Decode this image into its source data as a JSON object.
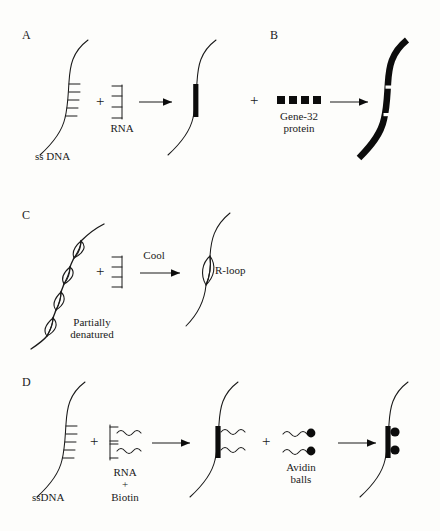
{
  "figure": {
    "background_color": "#fdfdfb",
    "ink_color": "#1a1a1a"
  },
  "panels": [
    {
      "id": "A",
      "letter": "A",
      "reactant_label": "ss DNA",
      "reagent_label": "RNA",
      "plus_1": "+",
      "description": "single stranded DNA plus RNA yields hybrid with black duplex bar"
    },
    {
      "id": "B",
      "letter": "B",
      "reagent_label": "Gene-32\nprotein",
      "plus_1": "+",
      "description": "gene-32 protein squares coat the ssDNA producing thick black strand with unstained hybrid gaps"
    },
    {
      "id": "C",
      "letter": "C",
      "reactant_label": "Partially\ndenatured",
      "arrow_label": "Cool",
      "product_label": "R-loop",
      "plus_1": "+",
      "description": "partially denatured duplex DNA with four bubbles plus RNA cooled to give a single R-loop"
    },
    {
      "id": "D",
      "letter": "D",
      "reactant_label": "ssDNA",
      "reagent_label": "RNA\n+\nBiotin",
      "reagent_label_2": "Avidin\nballs",
      "plus_1": "+",
      "plus_2": "+",
      "description": "ssDNA plus biotinylated RNA forms hybrid with tails, then avidin balls bind the biotin"
    }
  ],
  "glyphs": {
    "arrow": "arrow-right",
    "plus": "+",
    "square": "filled-square",
    "ball": "filled-circle"
  },
  "counts": {
    "gene32_squares": 4,
    "dna_ticks_panel_a": 5,
    "rna_ticks_panel_a": 4,
    "bubbles_panel_c": 4,
    "avidin_balls": 2,
    "biotin_tails": 2
  }
}
